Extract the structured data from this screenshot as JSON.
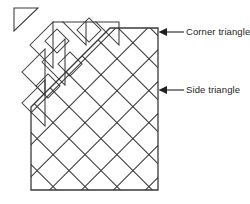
{
  "figure": {
    "type": "diagram",
    "background_color": "#ffffff",
    "line_color": "#3a3a3a",
    "label_color": "#231f20"
  },
  "labels": [
    {
      "id": "corner-triangle",
      "text": "Corner triangle",
      "leader": {
        "arrow_tip_x": 159,
        "arrow_tip_y": 32,
        "line_end_x": 184,
        "line_y": 32
      }
    },
    {
      "id": "side-triangle",
      "text": "Side triangle",
      "leader": {
        "arrow_tip_x": 159,
        "arrow_tip_y": 90,
        "line_end_x": 184,
        "line_y": 90
      }
    }
  ],
  "geometry": {
    "quilt_body": {
      "name": "quilt-top-outline",
      "left": 31,
      "right": 158,
      "top": 28,
      "bottom": 190,
      "diagonal_corner": "upper-left",
      "diagonal_from_x": 31,
      "diagonal_from_y": 107,
      "diagonal_to_x": 110,
      "diagonal_to_y": 28
    },
    "lattice": {
      "name": "on-point-diamond-lattice",
      "spacing": 22.6,
      "orientation": "45-degree"
    },
    "detached_triangles": [
      {
        "name": "corner-triangle-detached",
        "kind": "corner",
        "x": 12,
        "y": 6
      },
      {
        "name": "side-triangle-detached-1",
        "kind": "side",
        "x": 37,
        "y": 10
      },
      {
        "name": "side-triangle-detached-2",
        "kind": "side",
        "x": 70,
        "y": 22
      },
      {
        "name": "side-triangle-detached-3",
        "kind": "side",
        "x": 15,
        "y": 30
      },
      {
        "name": "side-triangle-detached-4",
        "kind": "side",
        "x": 22,
        "y": 65
      }
    ]
  }
}
